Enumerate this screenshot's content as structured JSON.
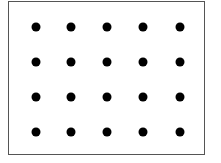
{
  "diagram": {
    "type": "dot-grid",
    "rows": 4,
    "columns": 5,
    "dot_color": "#000000",
    "border_color": "#555555",
    "background_color": "#ffffff",
    "column_x": [
      36,
      71,
      107,
      143,
      180
    ],
    "row_y": [
      27,
      62,
      97,
      132
    ]
  }
}
